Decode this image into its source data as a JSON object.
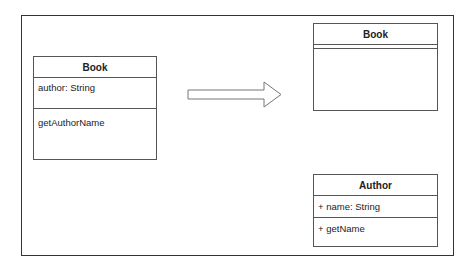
{
  "diagram": {
    "type": "uml-class-refactoring",
    "before": {
      "class": {
        "name": "Book",
        "attributes": [
          "author: String"
        ],
        "methods": [
          "getAuthorName"
        ]
      }
    },
    "arrow": {
      "direction": "right",
      "meaning": "transforms-to"
    },
    "after": {
      "classes": [
        {
          "name": "Book",
          "attributes": [],
          "methods": []
        },
        {
          "name": "Author",
          "attributes": [
            "+ name: String"
          ],
          "methods": [
            "+ getName"
          ]
        }
      ]
    }
  }
}
